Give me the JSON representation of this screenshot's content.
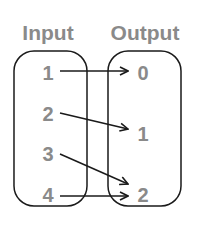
{
  "diagram": {
    "input_title": "Input",
    "output_title": "Output",
    "inputs": [
      "1",
      "2",
      "3",
      "4"
    ],
    "outputs": [
      "0",
      "1",
      "2"
    ],
    "mappings": [
      {
        "from": "1",
        "to": "0"
      },
      {
        "from": "2",
        "to": "1"
      },
      {
        "from": "3",
        "to": "2"
      },
      {
        "from": "4",
        "to": "2"
      }
    ],
    "colors": {
      "text": "#8a8a8a",
      "stroke": "#1a1a1a"
    }
  }
}
